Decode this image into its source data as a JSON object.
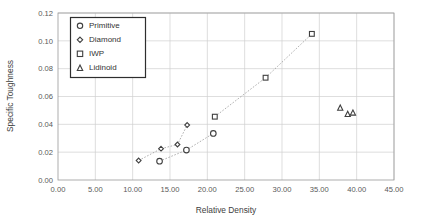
{
  "chart_data": {
    "type": "scatter",
    "title": "",
    "xlabel": "Relative Density",
    "ylabel": "Specific Toughness",
    "xlim": [
      0.0,
      45.0
    ],
    "ylim": [
      0.0,
      0.12
    ],
    "xticks": [
      "0.00",
      "5.00",
      "10.00",
      "15.00",
      "20.00",
      "25.00",
      "30.00",
      "35.00",
      "40.00",
      "45.00"
    ],
    "xtick_values": [
      0,
      5,
      10,
      15,
      20,
      25,
      30,
      35,
      40,
      45
    ],
    "yticks": [
      "0.00",
      "0.02",
      "0.04",
      "0.06",
      "0.08",
      "0.10",
      "0.12"
    ],
    "ytick_values": [
      0.0,
      0.02,
      0.04,
      0.06,
      0.08,
      0.1,
      0.12
    ],
    "grid": true,
    "legend_position": "top-left",
    "series": [
      {
        "name": "Primitive",
        "marker": "circle",
        "trendline": true,
        "points": [
          {
            "x": 13.6,
            "y": 0.0135
          },
          {
            "x": 17.2,
            "y": 0.0215
          },
          {
            "x": 20.8,
            "y": 0.0335
          }
        ]
      },
      {
        "name": "Diamond",
        "marker": "diamond",
        "trendline": true,
        "points": [
          {
            "x": 10.8,
            "y": 0.014
          },
          {
            "x": 13.8,
            "y": 0.0225
          },
          {
            "x": 16.0,
            "y": 0.0255
          },
          {
            "x": 17.3,
            "y": 0.0395
          }
        ]
      },
      {
        "name": "IWP",
        "marker": "square",
        "trendline": true,
        "points": [
          {
            "x": 21.0,
            "y": 0.0455
          },
          {
            "x": 27.8,
            "y": 0.0735
          },
          {
            "x": 34.0,
            "y": 0.105
          }
        ]
      },
      {
        "name": "Lidinoid",
        "marker": "triangle",
        "trendline": false,
        "points": [
          {
            "x": 37.8,
            "y": 0.052
          },
          {
            "x": 38.8,
            "y": 0.0475
          },
          {
            "x": 39.5,
            "y": 0.0485
          }
        ]
      }
    ]
  },
  "legend": {
    "items": [
      {
        "label": "Primitive",
        "marker": "circle"
      },
      {
        "label": "Diamond",
        "marker": "diamond"
      },
      {
        "label": "IWP",
        "marker": "square"
      },
      {
        "label": "Lidinoid",
        "marker": "triangle"
      }
    ]
  }
}
